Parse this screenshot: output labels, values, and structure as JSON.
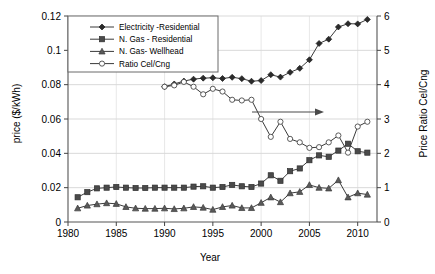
{
  "chart_data": {
    "type": "line",
    "title": "",
    "xlabel": "Year",
    "ylabel": "price ($/kWh)",
    "ylabel_right": "Price Ratio Cel/Cng",
    "xlim": [
      1980,
      2012
    ],
    "ylim": [
      0,
      0.12
    ],
    "ylim_right": [
      0,
      6
    ],
    "xticks": [
      1980,
      1985,
      1990,
      1995,
      2000,
      2005,
      2010
    ],
    "yticks": [
      0,
      0.02,
      0.04,
      0.06,
      0.08,
      0.1,
      0.12
    ],
    "yticks_right": [
      0,
      1,
      2,
      3,
      4,
      5,
      6
    ],
    "grid": true,
    "legend_position": "top-left",
    "annotation_arrow": "right-pointing arrow indicating right axis",
    "series": [
      {
        "name": "Electricity -Residential",
        "axis": "left",
        "marker": "diamond",
        "fill": "#2b2b2b",
        "x": [
          1990,
          1991,
          1992,
          1993,
          1994,
          1995,
          1996,
          1997,
          1998,
          1999,
          2000,
          2001,
          2002,
          2003,
          2004,
          2005,
          2006,
          2007,
          2008,
          2009,
          2010,
          2011
        ],
        "y": [
          0.0788,
          0.0804,
          0.0821,
          0.0832,
          0.0838,
          0.084,
          0.0836,
          0.0843,
          0.0835,
          0.082,
          0.0824,
          0.0858,
          0.0844,
          0.0872,
          0.0895,
          0.0945,
          0.104,
          0.1065,
          0.1136,
          0.1155,
          0.1154,
          0.118
        ]
      },
      {
        "name": "N. Gas - Residential",
        "axis": "right",
        "marker": "square",
        "fill": "#4a4a4a",
        "x": [
          1981,
          1982,
          1983,
          1984,
          1985,
          1986,
          1987,
          1988,
          1989,
          1990,
          1991,
          1992,
          1993,
          1994,
          1995,
          1996,
          1997,
          1998,
          1999,
          2000,
          2001,
          2002,
          2003,
          2004,
          2005,
          2006,
          2007,
          2008,
          2009,
          2010,
          2011
        ],
        "y": [
          0.72,
          0.87,
          0.98,
          1.0,
          1.02,
          1.0,
          0.99,
          0.99,
          1.0,
          1.0,
          1.0,
          1.0,
          1.03,
          1.04,
          1.0,
          1.02,
          1.08,
          1.04,
          1.02,
          1.12,
          1.36,
          1.2,
          1.48,
          1.56,
          1.8,
          1.94,
          1.9,
          2.08,
          2.28,
          2.06,
          2.02
        ]
      },
      {
        "name": "N. Gas- Wellhead",
        "axis": "right",
        "marker": "triangle",
        "fill": "#5a5a5a",
        "x": [
          1981,
          1982,
          1983,
          1984,
          1985,
          1986,
          1987,
          1988,
          1989,
          1990,
          1991,
          1992,
          1993,
          1994,
          1995,
          1996,
          1997,
          1998,
          1999,
          2000,
          2001,
          2002,
          2003,
          2004,
          2005,
          2006,
          2007,
          2008,
          2009,
          2010,
          2011
        ],
        "y": [
          0.4,
          0.48,
          0.52,
          0.55,
          0.53,
          0.44,
          0.4,
          0.39,
          0.39,
          0.4,
          0.38,
          0.4,
          0.44,
          0.42,
          0.36,
          0.44,
          0.48,
          0.41,
          0.41,
          0.56,
          0.72,
          0.58,
          0.84,
          0.88,
          1.08,
          1.0,
          0.98,
          1.22,
          0.72,
          0.84,
          0.8
        ]
      },
      {
        "name": "Ratio Cel/Cng",
        "axis": "right",
        "marker": "circle-open",
        "fill": "#ffffff",
        "x": [
          1990,
          1991,
          1992,
          1993,
          1994,
          1995,
          1996,
          1997,
          1998,
          1999,
          2000,
          2001,
          2002,
          2003,
          2004,
          2005,
          2006,
          2007,
          2008,
          2009,
          2010,
          2011
        ],
        "y": [
          3.94,
          3.98,
          4.08,
          3.94,
          3.72,
          3.88,
          3.8,
          3.56,
          3.54,
          3.56,
          3.0,
          2.48,
          2.92,
          2.42,
          2.32,
          2.16,
          2.18,
          2.32,
          2.52,
          2.02,
          2.78,
          2.92
        ]
      }
    ]
  },
  "legend": {
    "items": [
      {
        "label": "Electricity -Residential"
      },
      {
        "label": "N. Gas - Residential"
      },
      {
        "label": "N. Gas- Wellhead"
      },
      {
        "label": "Ratio Cel/Cng"
      }
    ]
  },
  "labels": {
    "y_left": "price ($/kWh)",
    "y_right": "Price Ratio Cel/Cng",
    "x": "Year"
  }
}
